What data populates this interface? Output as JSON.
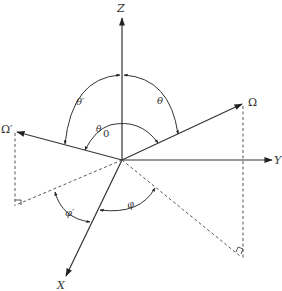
{
  "diagram": {
    "axes": {
      "z_label": "Z",
      "y_label": "Y",
      "x_label": "X"
    },
    "vectors": {
      "omega_label": "Ω",
      "omega_prime_label": "Ω′"
    },
    "angles": {
      "theta_label": "θ",
      "theta_prime_label": "θ′",
      "theta0_base": "θ",
      "theta0_sub": "0",
      "phi_label": "φ",
      "phi_prime_label": "φ′"
    }
  }
}
